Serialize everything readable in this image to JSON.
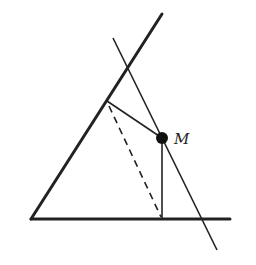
{
  "diagram": {
    "type": "geometry",
    "labels": {
      "point_m": "M"
    },
    "colors": {
      "stroke": "#222222",
      "background": "#ffffff"
    },
    "points": {
      "vertex": [
        31,
        219
      ],
      "side1_end": [
        162,
        14
      ],
      "side2_end": [
        230,
        219
      ],
      "M": [
        162,
        138
      ],
      "foot_side1": [
        107,
        101
      ],
      "foot_side2": [
        162,
        219
      ],
      "thin_line_start": [
        113,
        38
      ],
      "thin_line_end": [
        217,
        250
      ]
    }
  }
}
